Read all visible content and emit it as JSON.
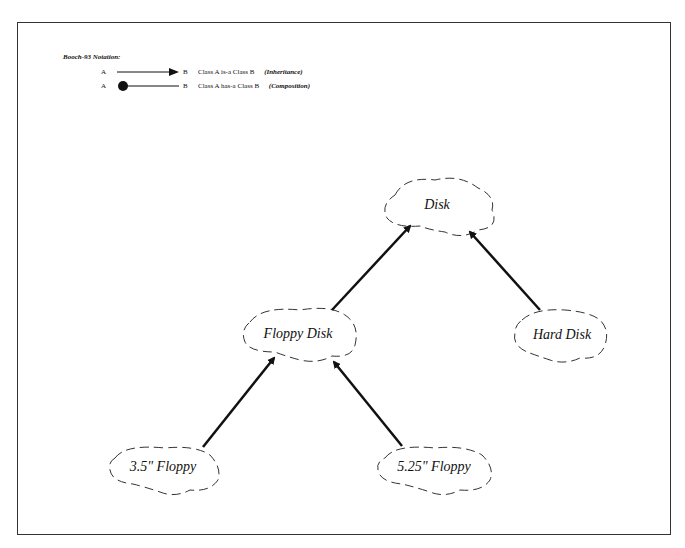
{
  "legend": {
    "title": "Booch-93 Notation:",
    "rows": [
      {
        "from": "A",
        "to": "B",
        "relation": "Class A  is-a  Class B",
        "note": "(Inheritance)",
        "symbol": "arrow-icon"
      },
      {
        "from": "A",
        "to": "B",
        "relation": "Class A  has-a  Class B",
        "note": "(Composition)",
        "symbol": "filled-circle-icon"
      }
    ]
  },
  "nodes": [
    {
      "id": "disk",
      "label": "Disk"
    },
    {
      "id": "floppy-disk",
      "label": "Floppy Disk"
    },
    {
      "id": "hard-disk",
      "label": "Hard Disk"
    },
    {
      "id": "floppy-35",
      "label": "3.5\" Floppy"
    },
    {
      "id": "floppy-525",
      "label": "5.25\" Floppy"
    }
  ],
  "edges": [
    {
      "from": "Floppy Disk",
      "to": "Disk",
      "type": "inheritance"
    },
    {
      "from": "Hard Disk",
      "to": "Disk",
      "type": "inheritance"
    },
    {
      "from": "3.5\" Floppy",
      "to": "Floppy Disk",
      "type": "inheritance"
    },
    {
      "from": "5.25\" Floppy",
      "to": "Floppy Disk",
      "type": "inheritance"
    }
  ]
}
